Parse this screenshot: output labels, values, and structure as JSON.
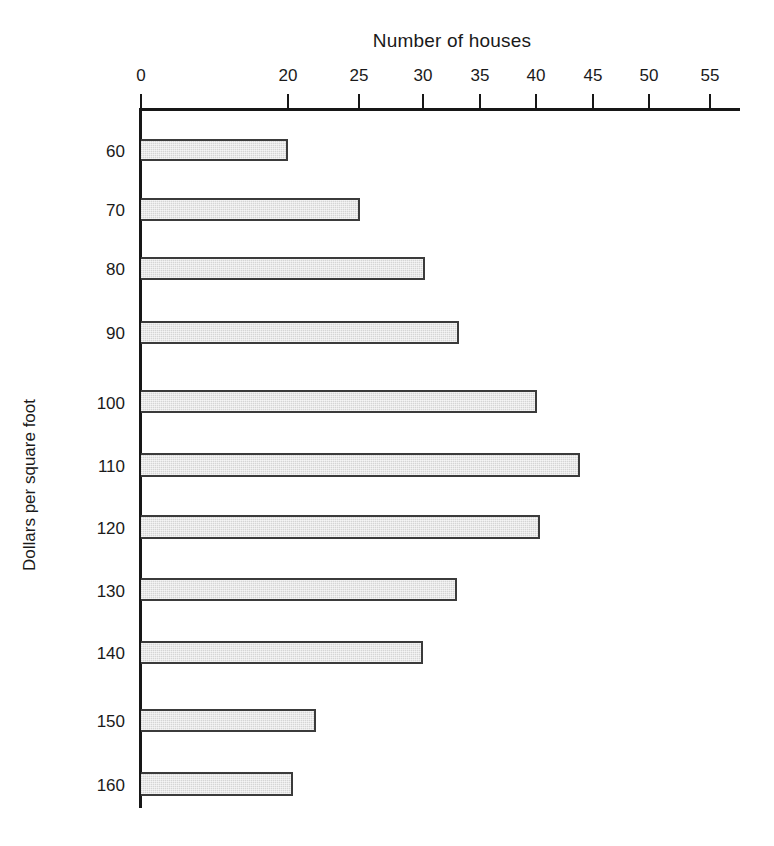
{
  "chart_data": {
    "type": "bar",
    "orientation": "horizontal",
    "title": "Number of houses",
    "xlabel": "Number of houses",
    "ylabel": "Dollars per square foot",
    "categories": [
      "60",
      "70",
      "80",
      "90",
      "100",
      "110",
      "120",
      "130",
      "140",
      "150",
      "160"
    ],
    "values": [
      20,
      25,
      30,
      33,
      40,
      44,
      40,
      33,
      30,
      22,
      20
    ],
    "x_tick_labels": [
      "0",
      "20",
      "25",
      "30",
      "35",
      "40",
      "45",
      "50",
      "55"
    ],
    "x_tick_values": [
      0,
      20,
      25,
      30,
      35,
      40,
      45,
      50,
      55
    ],
    "xlim": [
      0,
      57.5
    ],
    "axis_break": true,
    "axis_break_note": "x-axis compressed between 0 and 20",
    "grid": false,
    "legend": null,
    "bar_fill_color": "#e9e9e9",
    "bar_border_color": "#3b3b3b",
    "axis_color": "#171717"
  },
  "bars": [
    {
      "category": "60",
      "value": 20,
      "top": 139,
      "height": 22,
      "right": 288
    },
    {
      "category": "70",
      "value": 25,
      "top": 198,
      "height": 23,
      "right": 360
    },
    {
      "category": "80",
      "value": 30,
      "top": 257,
      "height": 23,
      "right": 425
    },
    {
      "category": "90",
      "value": 33,
      "top": 321,
      "height": 23,
      "right": 459
    },
    {
      "category": "100",
      "value": 40,
      "top": 390,
      "height": 23,
      "right": 537
    },
    {
      "category": "110",
      "value": 44,
      "top": 453,
      "height": 24,
      "right": 580
    },
    {
      "category": "120",
      "value": 40,
      "top": 515,
      "height": 24,
      "right": 540
    },
    {
      "category": "130",
      "value": 33,
      "top": 578,
      "height": 23,
      "right": 457
    },
    {
      "category": "140",
      "value": 30,
      "top": 641,
      "height": 23,
      "right": 423
    },
    {
      "category": "150",
      "value": 22,
      "top": 709,
      "height": 23,
      "right": 316
    },
    {
      "category": "160",
      "value": 20,
      "top": 772,
      "height": 24,
      "right": 293
    }
  ],
  "x_ticks": [
    {
      "label": "0",
      "x": 141
    },
    {
      "label": "20",
      "x": 288
    },
    {
      "label": "25",
      "x": 359
    },
    {
      "label": "30",
      "x": 423
    },
    {
      "label": "35",
      "x": 480
    },
    {
      "label": "40",
      "x": 536
    },
    {
      "label": "45",
      "x": 593
    },
    {
      "label": "50",
      "x": 649
    },
    {
      "label": "55",
      "x": 710
    }
  ],
  "y_ticks": [
    {
      "label": "60",
      "y": 152
    },
    {
      "label": "70",
      "y": 211
    },
    {
      "label": "80",
      "y": 270
    },
    {
      "label": "90",
      "y": 334
    },
    {
      "label": "100",
      "y": 404
    },
    {
      "label": "110",
      "y": 467
    },
    {
      "label": "120",
      "y": 529
    },
    {
      "label": "130",
      "y": 592
    },
    {
      "label": "140",
      "y": 654
    },
    {
      "label": "150",
      "y": 722
    },
    {
      "label": "160",
      "y": 786
    }
  ]
}
